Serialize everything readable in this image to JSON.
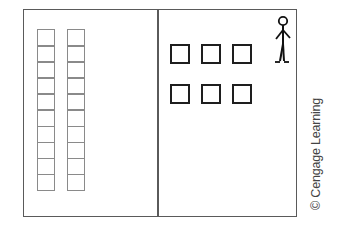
{
  "diagram": {
    "type": "place-value illustration",
    "left_panel": {
      "columns": [
        {
          "label": "ten-rod-1",
          "cells": 10
        },
        {
          "label": "ten-rod-2",
          "cells": 10
        }
      ],
      "stroke_color": "#8a8a8a"
    },
    "right_panel": {
      "unit_squares": {
        "rows": 2,
        "per_row": 3,
        "total": 6
      },
      "stroke_color": "#1e1e1e",
      "figure": "stick-person-icon"
    },
    "frame_color": "#5a5a5a"
  },
  "credit": "© Cengage Learning"
}
